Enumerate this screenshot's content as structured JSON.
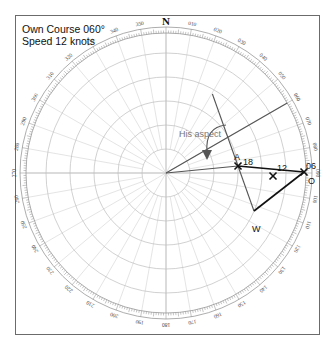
{
  "header": {
    "line1": "Own Course 060°",
    "line2": "Speed 12 knots"
  },
  "plot": {
    "center": [
      166,
      173
    ],
    "ring_radii": [
      24,
      48,
      72,
      96,
      120
    ],
    "band_inner": 140,
    "band_outer": 146,
    "north_label": "N",
    "degree_labels": [
      "010",
      "020",
      "030",
      "040",
      "050",
      "060",
      "070",
      "080",
      "090",
      "100",
      "110",
      "120",
      "130",
      "140",
      "150",
      "160",
      "170",
      "180",
      "190",
      "200",
      "210",
      "220",
      "230",
      "240",
      "250",
      "260",
      "270",
      "280",
      "290",
      "300",
      "310",
      "320",
      "330",
      "340",
      "350"
    ]
  },
  "vectors": {
    "own_course_deg": 60,
    "points": {
      "A": {
        "label": "A",
        "x": 238,
        "y": 166
      },
      "O": {
        "label": "O",
        "x": 304,
        "y": 172
      },
      "W": {
        "label": "W",
        "x": 254,
        "y": 211
      },
      "M12": {
        "label": "12",
        "x": 273,
        "y": 176
      }
    },
    "time_labels": {
      "A": "18",
      "O": "06"
    },
    "aspect_label": "His aspect"
  },
  "colors": {
    "vector": "#111111",
    "grid": "#bdbdbd",
    "aspect_text": "#777777"
  }
}
